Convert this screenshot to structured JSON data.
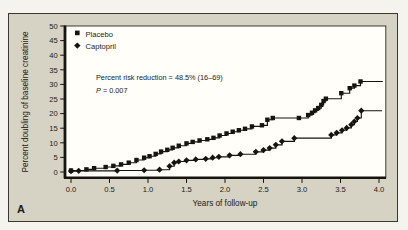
{
  "figure": {
    "panel_label": "A",
    "panel_background": "#d6d2c4",
    "plot_background": "#fffef9",
    "line_color": "#15140f",
    "text_color": "#1c1b16"
  },
  "chart_data": {
    "type": "line",
    "subtype": "kaplan-meier-step",
    "title": "",
    "xlabel": "Years of follow-up",
    "ylabel": "Percent doubling of baseline creatinine",
    "xlim": [
      0.0,
      4.0
    ],
    "ylim": [
      0,
      50
    ],
    "x_ticks": [
      0.0,
      0.5,
      1.0,
      1.5,
      2.0,
      2.5,
      3.0,
      3.5,
      4.0
    ],
    "y_ticks": [
      0,
      5,
      10,
      15,
      20,
      25,
      30,
      35,
      40,
      45,
      50
    ],
    "grid": false,
    "legend_position": "top-left-inside",
    "legend": [
      {
        "label": "Placebo",
        "marker": "square"
      },
      {
        "label": "Captopril",
        "marker": "diamond"
      }
    ],
    "annotation": {
      "line1": "Percent risk reduction = 48.5% (16–69)",
      "p_symbol": "P",
      "p_value_rest": " = 0.007"
    },
    "series": [
      {
        "name": "Placebo",
        "marker": "square",
        "points": [
          [
            0.0,
            0.5
          ],
          [
            0.2,
            0.9
          ],
          [
            0.3,
            1.3
          ],
          [
            0.45,
            1.7
          ],
          [
            0.55,
            2.1
          ],
          [
            0.65,
            2.6
          ],
          [
            0.75,
            3.2
          ],
          [
            0.85,
            4.1
          ],
          [
            0.95,
            4.9
          ],
          [
            1.02,
            5.4
          ],
          [
            1.1,
            6.2
          ],
          [
            1.17,
            7.0
          ],
          [
            1.25,
            7.6
          ],
          [
            1.32,
            8.3
          ],
          [
            1.4,
            9.0
          ],
          [
            1.5,
            9.8
          ],
          [
            1.58,
            10.3
          ],
          [
            1.67,
            10.8
          ],
          [
            1.77,
            11.2
          ],
          [
            1.85,
            11.7
          ],
          [
            1.93,
            12.5
          ],
          [
            2.02,
            13.2
          ],
          [
            2.1,
            13.8
          ],
          [
            2.18,
            14.3
          ],
          [
            2.26,
            14.8
          ],
          [
            2.35,
            15.6
          ],
          [
            2.48,
            16.0
          ],
          [
            2.55,
            17.9
          ],
          [
            2.62,
            18.5
          ],
          [
            2.96,
            18.5
          ],
          [
            3.08,
            19.5
          ],
          [
            3.13,
            20.3
          ],
          [
            3.17,
            21.1
          ],
          [
            3.21,
            21.9
          ],
          [
            3.25,
            23.0
          ],
          [
            3.28,
            24.3
          ],
          [
            3.31,
            25.1
          ],
          [
            3.51,
            27.0
          ],
          [
            3.62,
            28.7
          ],
          [
            3.68,
            29.6
          ],
          [
            3.76,
            31.0
          ],
          [
            4.05,
            31.0
          ]
        ]
      },
      {
        "name": "Captopril",
        "marker": "diamond",
        "points": [
          [
            0.0,
            0.3
          ],
          [
            0.1,
            0.4
          ],
          [
            0.6,
            0.5
          ],
          [
            0.95,
            0.6
          ],
          [
            1.15,
            0.8
          ],
          [
            1.28,
            2.0
          ],
          [
            1.34,
            3.2
          ],
          [
            1.4,
            3.6
          ],
          [
            1.5,
            4.0
          ],
          [
            1.62,
            4.3
          ],
          [
            1.75,
            4.5
          ],
          [
            1.84,
            4.9
          ],
          [
            1.92,
            5.2
          ],
          [
            2.06,
            5.7
          ],
          [
            2.2,
            6.1
          ],
          [
            2.4,
            6.9
          ],
          [
            2.5,
            7.5
          ],
          [
            2.58,
            8.2
          ],
          [
            2.66,
            9.3
          ],
          [
            2.74,
            10.5
          ],
          [
            2.9,
            11.6
          ],
          [
            3.38,
            12.7
          ],
          [
            3.45,
            13.4
          ],
          [
            3.52,
            14.3
          ],
          [
            3.58,
            15.1
          ],
          [
            3.64,
            16.2
          ],
          [
            3.68,
            17.3
          ],
          [
            3.72,
            18.5
          ],
          [
            3.77,
            21.0
          ],
          [
            4.04,
            21.0
          ]
        ]
      }
    ]
  }
}
